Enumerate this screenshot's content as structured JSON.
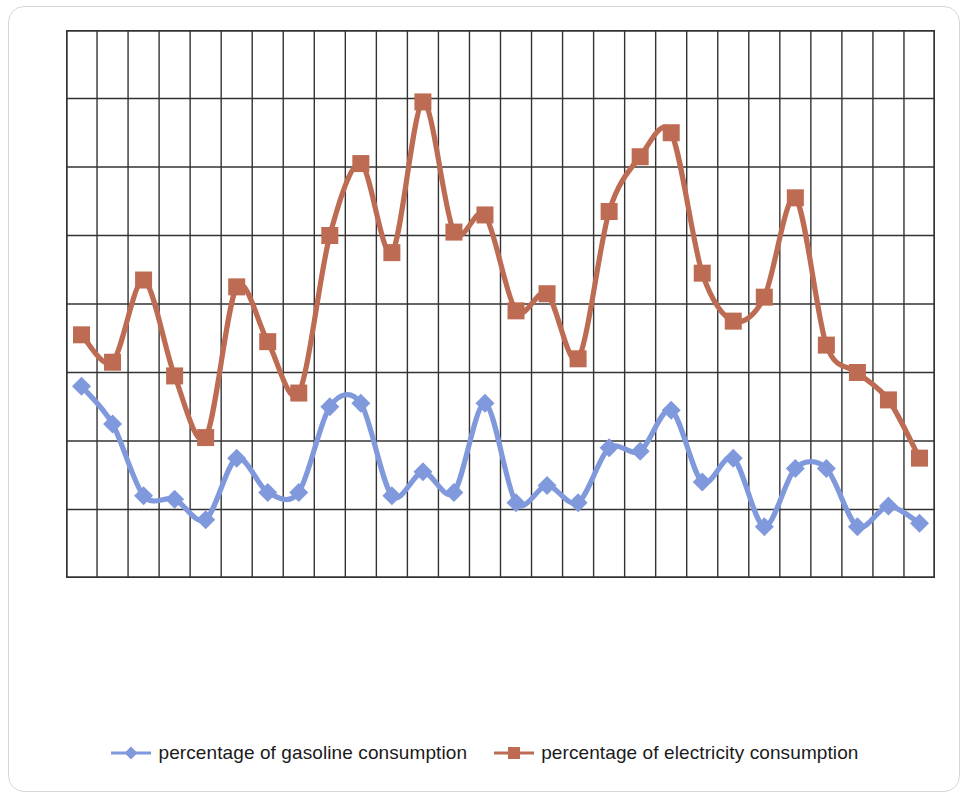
{
  "chart_data": {
    "type": "line",
    "title": "",
    "subtitle": "",
    "xlabel": "",
    "ylabel": "",
    "grid": true,
    "grid_columns": 28,
    "grid_rows": 8,
    "legend_position": "bottom",
    "ylim": [
      0,
      8
    ],
    "axis_tick_labels_visible": false,
    "x": [
      1,
      2,
      3,
      4,
      5,
      6,
      7,
      8,
      9,
      10,
      11,
      12,
      13,
      14,
      15,
      16,
      17,
      18,
      19,
      20,
      21,
      22,
      23,
      24,
      25,
      26,
      27,
      28
    ],
    "categories": [
      "1",
      "2",
      "3",
      "4",
      "5",
      "6",
      "7",
      "8",
      "9",
      "10",
      "11",
      "12",
      "13",
      "14",
      "15",
      "16",
      "17",
      "18",
      "19",
      "20",
      "21",
      "22",
      "23",
      "24",
      "25",
      "26",
      "27",
      "28"
    ],
    "series": [
      {
        "name": "percentage of gasoline consumption",
        "color": "#8099dc",
        "marker": "diamond",
        "values": [
          2.8,
          2.25,
          1.2,
          1.15,
          0.85,
          1.75,
          1.25,
          1.25,
          2.5,
          2.55,
          1.2,
          1.55,
          1.25,
          2.55,
          1.1,
          1.35,
          1.1,
          1.9,
          1.85,
          2.45,
          1.4,
          1.75,
          0.75,
          1.6,
          1.6,
          0.75,
          1.05,
          0.8
        ]
      },
      {
        "name": "percentage of electricity consumption",
        "color": "#bd6b52",
        "marker": "square",
        "values": [
          3.55,
          3.15,
          4.35,
          2.95,
          2.05,
          4.25,
          3.45,
          2.7,
          5.0,
          6.05,
          4.75,
          6.95,
          5.05,
          5.3,
          3.9,
          4.15,
          3.2,
          5.35,
          6.15,
          6.5,
          4.45,
          3.75,
          4.1,
          5.55,
          3.4,
          3.0,
          2.6,
          1.75
        ]
      }
    ]
  },
  "legend": {
    "entries": [
      {
        "label": "percentage of gasoline consumption",
        "color": "#8099dc",
        "marker": "diamond",
        "icon": "line-with-diamond-marker-icon"
      },
      {
        "label": "percentage of electricity consumption",
        "color": "#bd6b52",
        "marker": "square",
        "icon": "line-with-square-marker-icon"
      }
    ]
  },
  "colors": {
    "gasoline": "#8099dc",
    "electricity": "#bd6b52",
    "grid": "#333333",
    "background": "#ffffff"
  }
}
